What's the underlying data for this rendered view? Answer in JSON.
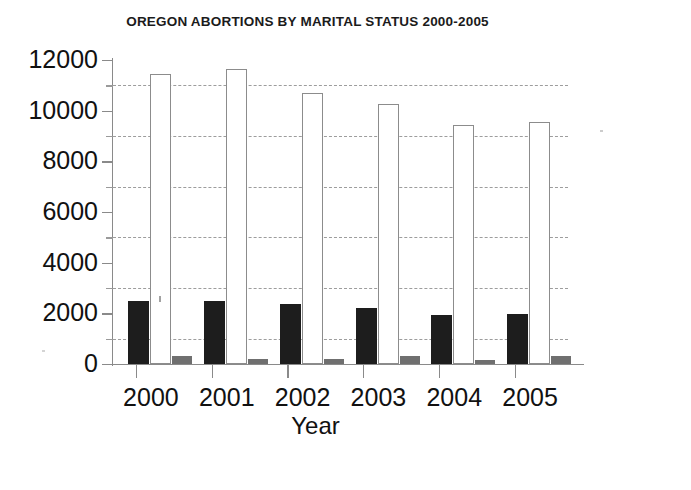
{
  "chart_data": {
    "type": "bar",
    "title": "OREGON ABORTIONS BY MARITAL STATUS 2000-2005",
    "xlabel": "Year",
    "ylabel": "",
    "categories": [
      "2000",
      "2001",
      "2002",
      "2003",
      "2004",
      "2005"
    ],
    "series": [
      {
        "name": "Married",
        "color": "#1d1d1d",
        "values": [
          2500,
          2500,
          2350,
          2200,
          1950,
          1980
        ]
      },
      {
        "name": "Unmarried",
        "color": "#ffffff",
        "values": [
          11450,
          11650,
          10700,
          10250,
          9450,
          9550
        ]
      },
      {
        "name": "Unknown",
        "color": "#6f6f6f",
        "values": [
          320,
          180,
          190,
          330,
          170,
          300
        ]
      }
    ],
    "ylim": [
      0,
      12000
    ],
    "ytick_labels": [
      "0",
      "2000",
      "4000",
      "6000",
      "8000",
      "10000",
      "12000"
    ],
    "ytick_values": [
      0,
      2000,
      4000,
      6000,
      8000,
      10000,
      12000
    ],
    "gridline_values": [
      1000,
      3000,
      5000,
      7000,
      9000,
      11000
    ],
    "grid": true,
    "legend": "none"
  }
}
